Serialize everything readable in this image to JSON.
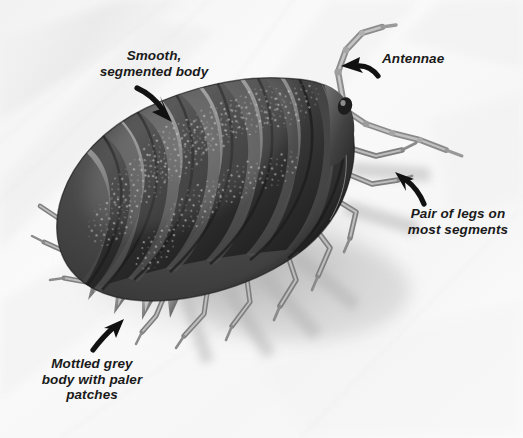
{
  "figure": {
    "background_color": "#f5f5f5",
    "body_dark_color": "#3c3c3c",
    "body_mid_color": "#6a6a6a",
    "body_light_color": "#b9b9b9",
    "label_color": "#1a1a1a",
    "arrow_color": "#111111",
    "shadow_color": "#bdbdbd"
  },
  "labels": {
    "smooth": {
      "text": "Smooth,\nsegmented body",
      "arrow": "arrow-down-right"
    },
    "antennae": {
      "text": "Antennae",
      "arrow": "arrow-left"
    },
    "legs": {
      "text": "Pair of legs on\nmost segments",
      "arrow": "arrow-up-left"
    },
    "mottled": {
      "text": "Mottled grey\nbody with paler\npatches",
      "arrow": "arrow-up-right"
    }
  },
  "anatomy": {
    "segment_count": 7,
    "antennae_count": 2,
    "uropod_count": 4,
    "left_leg_count": 6,
    "right_leg_count": 5
  }
}
